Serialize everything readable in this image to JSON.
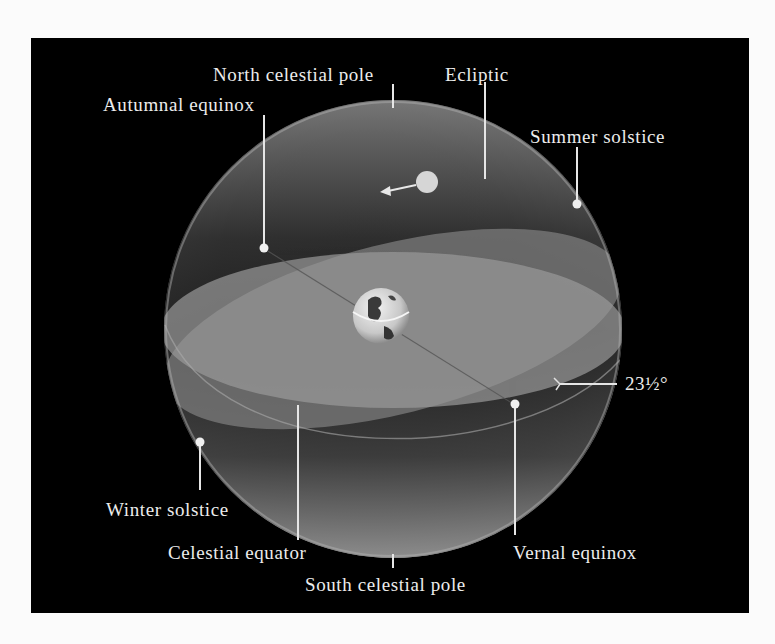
{
  "figure": {
    "background_color": "#000000",
    "page_color": "#fbfbfb",
    "sphere_color": "#8a8a8a",
    "label_color": "#ececec"
  },
  "labels": {
    "north_celestial_pole": "North celestial pole",
    "ecliptic": "Ecliptic",
    "autumnal_equinox": "Autumnal equinox",
    "summer_solstice": "Summer solstice",
    "tilt_angle": "23½°",
    "winter_solstice": "Winter solstice",
    "celestial_equator": "Celestial equator",
    "vernal_equinox": "Vernal equinox",
    "south_celestial_pole": "South celestial pole"
  },
  "elements": {
    "earth": "earth-globe",
    "sun": "sun",
    "sun_motion_arrow": "arrow-left"
  }
}
